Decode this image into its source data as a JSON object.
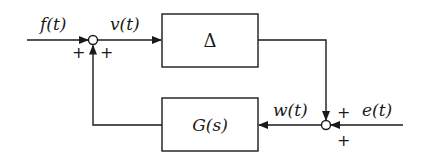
{
  "diagram": {
    "type": "block-diagram",
    "colors": {
      "stroke": "#1a1a1a",
      "background": "#ffffff"
    },
    "blocks": {
      "delta": {
        "label": "Δ"
      },
      "g": {
        "label": "G(s)"
      }
    },
    "signals": {
      "f": {
        "label": "f(t)"
      },
      "v": {
        "label": "v(t)"
      },
      "w": {
        "label": "w(t)"
      },
      "e": {
        "label": "e(t)"
      }
    },
    "junctions": {
      "left": {
        "signs": [
          "+",
          "+"
        ]
      },
      "right": {
        "signs": [
          "+",
          "+"
        ]
      }
    }
  }
}
